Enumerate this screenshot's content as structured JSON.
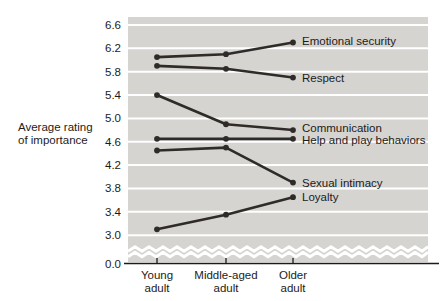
{
  "chart_data": {
    "type": "line",
    "title": "",
    "ylabel": "Average rating of importance",
    "ylabel_lines": [
      "Average rating",
      "of importance"
    ],
    "categories": [
      "Young adult",
      "Middle-aged adult",
      "Older adult"
    ],
    "series": [
      {
        "name": "Emotional security",
        "values": [
          6.05,
          6.1,
          6.3
        ]
      },
      {
        "name": "Respect",
        "values": [
          5.9,
          5.85,
          5.7
        ]
      },
      {
        "name": "Communication",
        "values": [
          5.4,
          4.9,
          4.8
        ]
      },
      {
        "name": "Help and play behaviors",
        "values": [
          4.65,
          4.65,
          4.65
        ]
      },
      {
        "name": "Sexual intimacy",
        "values": [
          4.45,
          4.5,
          3.9
        ]
      },
      {
        "name": "Loyalty",
        "values": [
          3.1,
          3.35,
          3.65
        ]
      }
    ],
    "yticks": [
      6.6,
      6.2,
      5.8,
      5.4,
      5.0,
      4.6,
      4.2,
      3.8,
      3.4,
      3.0
    ],
    "axis_break": {
      "enabled": true,
      "bottom_tick": "0.0"
    },
    "ylim": [
      3.0,
      6.6
    ],
    "grid": true,
    "legend_position": "labels-at-line-ends-right",
    "marker": "filled-circle",
    "colors": {
      "line": "#2e2b29",
      "plot_background": "#d6d4d1",
      "gridline": "#ffffff",
      "text": "#1d1b1a",
      "axis": "#1d1b1a"
    }
  }
}
